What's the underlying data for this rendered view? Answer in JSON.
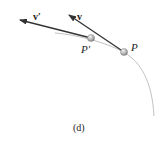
{
  "figure": {
    "caption": "(d)",
    "labels": {
      "v_prime": "v′",
      "v": "v",
      "p_prime": "P′",
      "p": "P"
    },
    "colors": {
      "path": "#bdbdbd",
      "arrow": "#333333",
      "particle": "#9a9a9a"
    }
  }
}
